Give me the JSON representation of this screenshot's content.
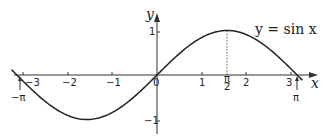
{
  "chart_data": {
    "type": "line",
    "title": "",
    "xlabel": "x",
    "ylabel": "y",
    "xlim": [
      -3.2,
      3.6
    ],
    "ylim": [
      -1.2,
      1.3
    ],
    "x_ticks": [
      -3,
      -2,
      -1,
      0,
      1,
      2,
      3
    ],
    "x_tick_labels": [
      "−3",
      "−2",
      "−1",
      "0",
      "1",
      "2",
      "3"
    ],
    "y_ticks": [
      1,
      -1
    ],
    "y_tick_labels": [
      "1",
      "−1"
    ],
    "series": [
      {
        "name": "y = sin x",
        "function": "sin(x)",
        "domain": [
          -3.1416,
          3.1416
        ]
      }
    ],
    "annotations": [
      {
        "text": "−π",
        "x": -3.1416,
        "y": 0,
        "type": "arrow-label-below"
      },
      {
        "text": "π",
        "x": 3.1416,
        "y": 0,
        "type": "arrow-label-below"
      },
      {
        "text": "π/2",
        "x": 1.5708,
        "y": 0,
        "type": "tick-label-with-dotted-line-to-max"
      },
      {
        "text": "y = sin x",
        "x": 2.5,
        "y": 1.0,
        "type": "curve-label"
      }
    ],
    "grid": false,
    "legend": "none"
  },
  "labels": {
    "xaxis": "x",
    "yaxis": "y",
    "curve": "y = sin x",
    "neg_pi": "−π",
    "pi": "π",
    "pi_num": "π",
    "pi_den": "2",
    "xm3": "−3",
    "xm2": "−2",
    "xm1": "−1",
    "x0": "0",
    "x1": "1",
    "x2": "2",
    "x3": "3",
    "y1": "1",
    "ym1": "−1"
  }
}
